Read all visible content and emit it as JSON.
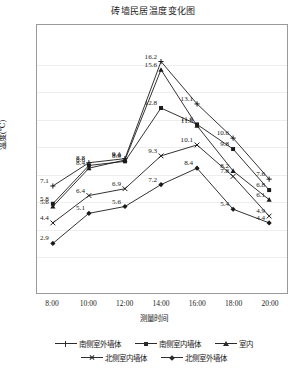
{
  "chart_data": {
    "type": "line",
    "title": "砖墙民居温度变化图",
    "xlabel": "测量时间",
    "ylabel": "温度(℃)",
    "categories": [
      "8:00",
      "10:00",
      "12:00",
      "14:00",
      "16:00",
      "18:00",
      "20:00"
    ],
    "ylim": [
      0,
      18
    ],
    "grid": true,
    "legend_position": "bottom",
    "series": [
      {
        "name": "南侧室外墙体",
        "marker": "plus",
        "values": [
          7.1,
          8.8,
          9.1,
          16.2,
          13.1,
          10.6,
          7.6
        ]
      },
      {
        "name": "南侧室内墙体",
        "marker": "square",
        "values": [
          5.8,
          8.6,
          8.9,
          12.8,
          11.6,
          9.8,
          6.8
        ]
      },
      {
        "name": "室内",
        "marker": "triangle",
        "values": [
          5.6,
          8.4,
          9.0,
          15.6,
          11.5,
          8.2,
          6.1
        ]
      },
      {
        "name": "北侧室内墙体",
        "marker": "x",
        "values": [
          4.4,
          6.4,
          6.9,
          9.3,
          10.1,
          7.8,
          4.9
        ]
      },
      {
        "name": "北侧室外墙体",
        "marker": "diamond",
        "values": [
          2.9,
          5.1,
          5.6,
          7.2,
          8.4,
          5.4,
          4.4
        ]
      }
    ],
    "point_labels": {
      "8:00": [
        "7.1",
        "5.8",
        "5.6",
        "4.4",
        "2.9"
      ],
      "10:00": [
        "8.8",
        "8.6",
        "8.4",
        "6.4",
        "5.1"
      ],
      "12:00": [
        "9.1",
        "9.0",
        "8.9",
        "6.9",
        "5.6"
      ],
      "14:00": [
        "16.2",
        "15.6",
        "12.8",
        "9.3",
        "7.2"
      ],
      "16:00": [
        "13.1",
        "11.6",
        "11.5",
        "10.1",
        "8.4"
      ],
      "18:00": [
        "10.6",
        "9.8",
        "8.2",
        "7.8",
        "5.4"
      ],
      "20:00": [
        "7.6",
        "6.8",
        "6.1",
        "4.9",
        "4.4"
      ]
    }
  }
}
